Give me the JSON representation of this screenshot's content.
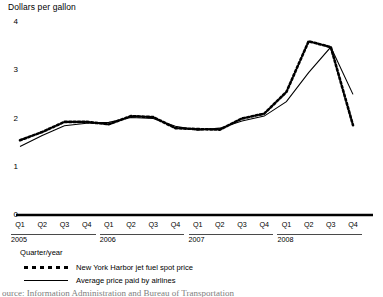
{
  "chart": {
    "axis_title": "Dollars per gallon",
    "x_axis_caption": "Quarter/year"
  },
  "source": {
    "text": "ource: Information Administration and Bureau of Transportation"
  },
  "legend": [
    {
      "label": "New York Harbor jet fuel spot price",
      "style": "dotted",
      "key_name": "legend-key-dotted"
    },
    {
      "label": "Average price paid by airlines",
      "style": "solid",
      "key_name": "legend-key-solid"
    }
  ],
  "years": [
    {
      "label": "2005"
    },
    {
      "label": "2006"
    },
    {
      "label": "2007"
    },
    {
      "label": "2008"
    }
  ],
  "chart_data": {
    "type": "line",
    "title": "Dollars per gallon",
    "xlabel": "Quarter/year",
    "ylabel": "Dollars per gallon",
    "ylim": [
      0,
      4
    ],
    "yticks": [
      0,
      1,
      2,
      3,
      4
    ],
    "ytick_labels": [
      "0",
      "1",
      "2",
      "3",
      "4"
    ],
    "grid": false,
    "legend_position": "below-axis",
    "categories": [
      "Q1 2005",
      "Q2 2005",
      "Q3 2005",
      "Q4 2005",
      "Q1 2006",
      "Q2 2006",
      "Q3 2006",
      "Q4 2006",
      "Q1 2007",
      "Q2 2007",
      "Q3 2007",
      "Q4 2007",
      "Q1 2008",
      "Q2 2008",
      "Q3 2008",
      "Q4 2008"
    ],
    "tick_labels": [
      "Q1",
      "Q2",
      "Q3",
      "Q4",
      "Q1",
      "Q2",
      "Q3",
      "Q4",
      "Q1",
      "Q2",
      "Q3",
      "Q4",
      "Q1",
      "Q2",
      "Q3",
      "Q4"
    ],
    "series": [
      {
        "name": "New York Harbor jet fuel spot price",
        "style": "dotted",
        "values": [
          1.55,
          1.72,
          1.93,
          1.93,
          1.88,
          2.05,
          2.03,
          1.8,
          1.78,
          1.77,
          2.0,
          2.1,
          2.55,
          3.6,
          3.48,
          1.86
        ]
      },
      {
        "name": "Average price paid by airlines",
        "style": "solid",
        "values": [
          1.42,
          1.65,
          1.85,
          1.9,
          1.92,
          2.02,
          2.0,
          1.84,
          1.76,
          1.8,
          1.95,
          2.05,
          2.35,
          2.95,
          3.48,
          2.5
        ]
      }
    ]
  }
}
